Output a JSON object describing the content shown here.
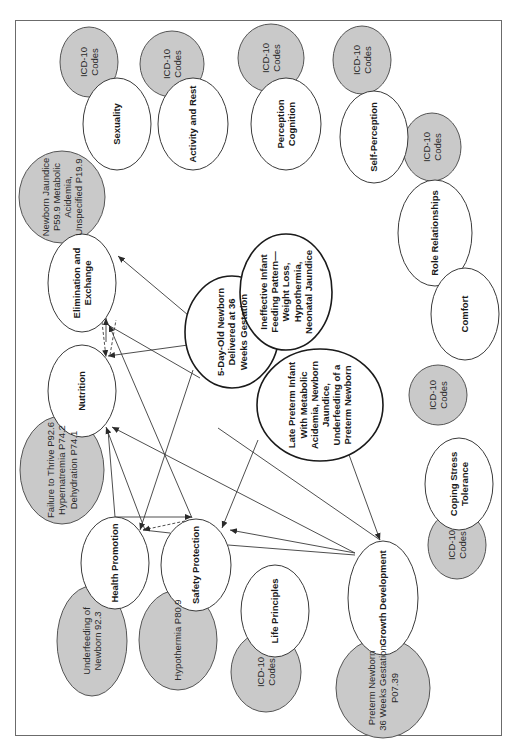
{
  "diagram": {
    "orientation": "rotated-90-ccw",
    "colors": {
      "border": "#6b6b6b",
      "node_fill": "#ffffff",
      "icd_fill": "#c9c9c9",
      "edge": "#3a3a3a"
    },
    "core": {
      "patient": "5-Day-Old Newborn Delivered at 36 Weeks Gestation",
      "nursing_diagnosis": "Ineffective Infant Feeding Pattern—Weight Loss, Hypothermia, Neonatal Jaundice",
      "medical_diagnosis": "Late Preterm Infant With Metabolic Acidemia, Newborn Jaundice, Underfeeding of a Preterm Newborn"
    },
    "domains": [
      {
        "id": "sexuality",
        "label": "Sexuality",
        "icd": "ICD-10 Codes"
      },
      {
        "id": "activity",
        "label": "Activity and Rest",
        "icd": "ICD-10 Codes"
      },
      {
        "id": "perception",
        "label": "Perception Cognition",
        "icd": "ICD-10 Codes"
      },
      {
        "id": "self",
        "label": "Self-Perception",
        "icd": "ICD-10 Codes"
      },
      {
        "id": "role",
        "label": "Role Relationships",
        "icd": "ICD-10 Codes"
      },
      {
        "id": "comfort",
        "label": "Comfort",
        "icd": "ICD-10 Codes"
      },
      {
        "id": "coping",
        "label": "Coping Stress Tolerance",
        "icd": "ICD-10 Codes"
      },
      {
        "id": "elimination",
        "label": "Elimination and Exchange",
        "icd": "Newborn Jaundice P59.9 Metabolic Acidemia, Unspecified P19.9"
      },
      {
        "id": "nutrition",
        "label": "Nutrition",
        "icd": "Failure to Thrive P92.6 Hypernatremia P74.2 Dehydration P74.1"
      },
      {
        "id": "health",
        "label": "Health Promotion",
        "icd": "Underfeeding of Newborn 92.3"
      },
      {
        "id": "safety",
        "label": "Safety Protection",
        "icd": "Hypothermia P80.9"
      },
      {
        "id": "life",
        "label": "Life Principles",
        "icd": "ICD-10 Codes"
      },
      {
        "id": "growth",
        "label": "Growth Development",
        "icd": "Preterm Newborn 36 Weeks Gestation P07.39"
      }
    ]
  }
}
